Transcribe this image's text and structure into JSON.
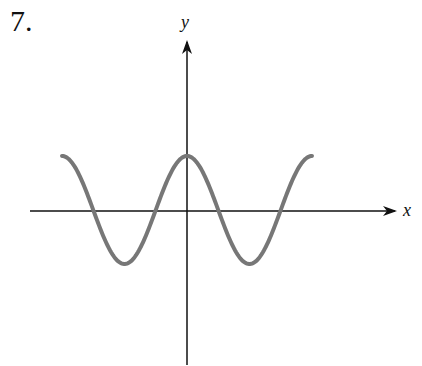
{
  "problem_number": "7.",
  "chart_data": {
    "type": "line",
    "title": "",
    "xlabel": "x",
    "ylabel": "y",
    "function_shape": "y = A cos(kx)",
    "series": [
      {
        "name": "curve",
        "color": "#777777",
        "points_px": [
          [
            62,
            156
          ],
          [
            125,
            264
          ],
          [
            187,
            156
          ],
          [
            249,
            264
          ],
          [
            312,
            156
          ]
        ]
      }
    ],
    "x_intercepts_count": 4,
    "grid": false,
    "ticks": "none"
  },
  "axes": {
    "x_label": "x",
    "y_label": "y",
    "color": "#111111"
  }
}
